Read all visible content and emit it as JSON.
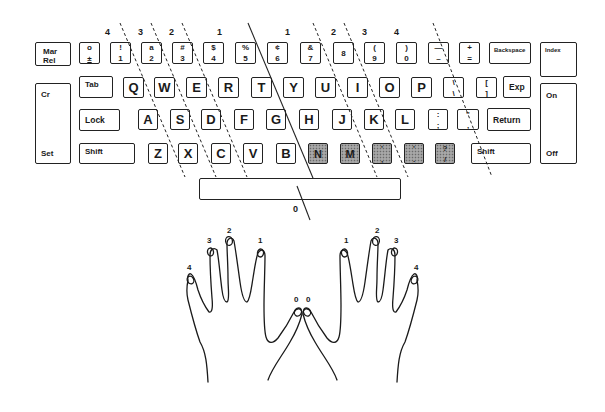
{
  "keyboard": {
    "left_column": {
      "mar_rel": "Mar\nRel",
      "cr": "Cr",
      "set": "Set"
    },
    "number_row": [
      {
        "top": "o",
        "bottom": "±"
      },
      {
        "top": "!",
        "bottom": "1"
      },
      {
        "top": "a",
        "bottom": "2"
      },
      {
        "top": "#",
        "bottom": "3"
      },
      {
        "top": "$",
        "bottom": "4"
      },
      {
        "top": "%",
        "bottom": "5"
      },
      {
        "top": "¢",
        "bottom": "6"
      },
      {
        "top": "&",
        "bottom": "7"
      },
      {
        "top": "",
        "bottom": "8"
      },
      {
        "top": "(",
        "bottom": "9"
      },
      {
        "top": ")",
        "bottom": "0"
      },
      {
        "top": "—",
        "bottom": "–"
      },
      {
        "top": "+",
        "bottom": "="
      }
    ],
    "backspace": "Backspace",
    "tab": "Tab",
    "top_row": [
      "Q",
      "W",
      "E",
      "R",
      "T",
      "Y",
      "U",
      "I",
      "O",
      "P"
    ],
    "top_row_symbols": [
      {
        "top": "\\",
        "bottom": "\\"
      },
      {
        "top": "[",
        "bottom": "]"
      }
    ],
    "exp": "Exp",
    "lock": "Lock",
    "home_row": [
      "A",
      "S",
      "D",
      "F",
      "G",
      "H",
      "J",
      "K",
      "L"
    ],
    "home_row_symbols": [
      {
        "top": ":",
        "bottom": ";"
      },
      {
        "top": "\"",
        "bottom": ","
      }
    ],
    "return": "Return",
    "shift_left": "Shift",
    "bottom_row": [
      "Z",
      "X",
      "C",
      "V",
      "B"
    ],
    "bottom_row_shaded": [
      {
        "label": "N"
      },
      {
        "label": "M"
      },
      {
        "top": "'",
        "bottom": ","
      },
      {
        "top": "'",
        "bottom": "."
      },
      {
        "top": "?",
        "bottom": "/"
      }
    ],
    "shift_right": "Shift",
    "right_column": {
      "index": "Index",
      "on": "On",
      "off": "Off"
    },
    "spacebar_label": "0"
  },
  "finger_zone_labels": {
    "left": [
      "4",
      "3",
      "2",
      "1"
    ],
    "right": [
      "1",
      "2",
      "3",
      "4"
    ]
  },
  "hands": {
    "left_fingers": [
      "4",
      "3",
      "2",
      "1",
      "0"
    ],
    "right_fingers": [
      "0",
      "1",
      "2",
      "3",
      "4"
    ]
  }
}
